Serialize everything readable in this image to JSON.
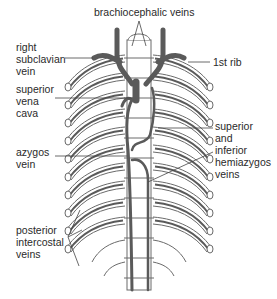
{
  "diagram": {
    "colors": {
      "vein": "#5a5a5a",
      "bone_outline": "#6a6a6a",
      "label_text": "#2a2a2a",
      "leader_line": "#444444",
      "background": "#ffffff"
    },
    "labels": {
      "brachiocephalic": {
        "lines": [
          "brachiocephalic veins"
        ]
      },
      "right_subclavian": {
        "lines": [
          "right",
          "subclavian",
          "vein"
        ]
      },
      "first_rib": {
        "lines": [
          "1st rib"
        ]
      },
      "svc": {
        "lines": [
          "superior",
          "vena",
          "cava"
        ]
      },
      "azygos": {
        "lines": [
          "azygos",
          "vein"
        ]
      },
      "hemiazygos": {
        "lines": [
          "superior",
          "and",
          "inferior",
          "hemiazygos",
          "veins"
        ]
      },
      "intercostal": {
        "lines": [
          "posterior",
          "intercostal",
          "veins"
        ]
      }
    }
  }
}
